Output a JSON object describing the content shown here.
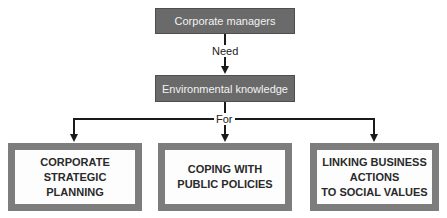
{
  "diagram": {
    "top_node": {
      "label": "Corporate managers"
    },
    "edge_1": {
      "label": "Need"
    },
    "middle_node": {
      "label": "Environmental knowledge"
    },
    "edge_2": {
      "label": "For"
    },
    "outcomes": [
      {
        "label": "CORPORATE\nSTRATEGIC\nPLANNING"
      },
      {
        "label": "COPING WITH\nPUBLIC POLICIES"
      },
      {
        "label": "LINKING BUSINESS\nACTIONS\nTO SOCIAL VALUES"
      }
    ],
    "colors": {
      "dark_box": "#6a6a6a",
      "outline_box": "#7d7d7d",
      "line": "#1a1a1a"
    }
  }
}
